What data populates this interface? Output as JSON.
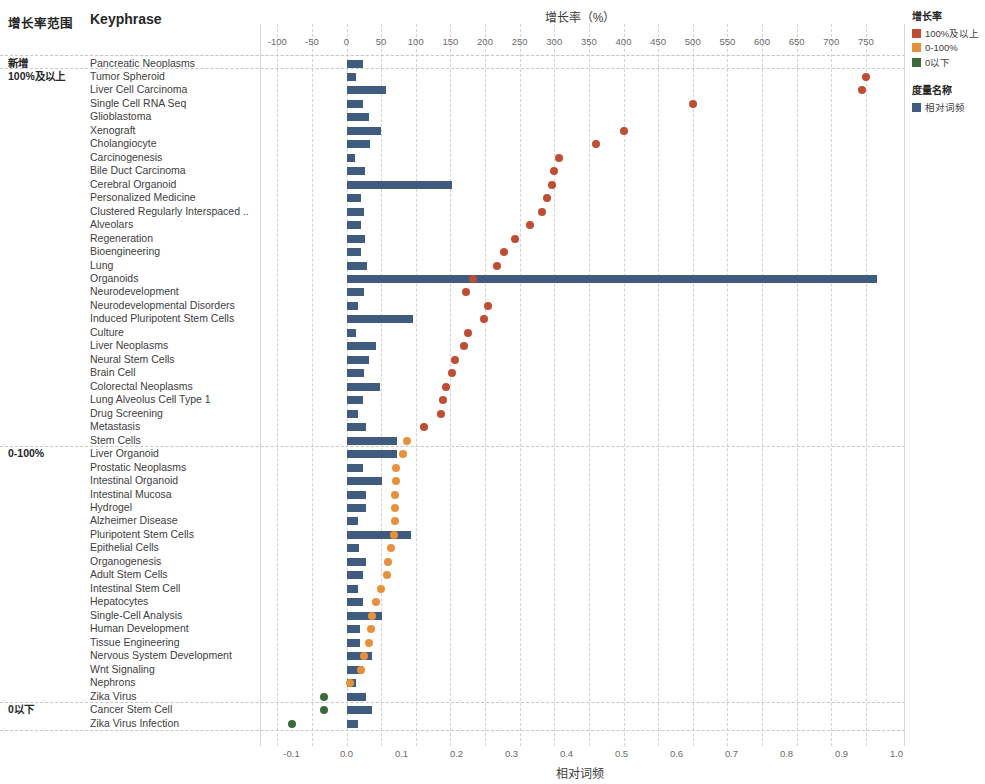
{
  "headers": {
    "range_column": "增长率范围",
    "keyphrase_column": "Keyphrase",
    "top_axis_title": "增长率（%）",
    "bottom_axis_title": "相对词频"
  },
  "legend": {
    "growth_title": "增长率",
    "growth_items": [
      {
        "label": "100%及以上",
        "color": "#bf4d33"
      },
      {
        "label": "0-100%",
        "color": "#e8913c"
      },
      {
        "label": "0以下",
        "color": "#3c6b3b"
      }
    ],
    "measure_title": "度量名称",
    "measure_items": [
      {
        "label": "相对词频",
        "color": "#3f5b7d"
      }
    ]
  },
  "groups": [
    {
      "label": "新增",
      "row_start": 0,
      "row_end": 0
    },
    {
      "label": "100%及以上",
      "row_start": 1,
      "row_end": 28
    },
    {
      "label": "0-100%",
      "row_start": 29,
      "row_end": 47
    },
    {
      "label": "0以下",
      "row_start": 48,
      "row_end": 50
    }
  ],
  "chart_data": {
    "type": "bar",
    "title": "增长率（%）",
    "xlabel": "相对词频",
    "x2label": "增长率（%）",
    "grid": true,
    "legend_position": "right",
    "top_axis": {
      "label": "增长率（%）",
      "ticks": [
        -100,
        -50,
        0,
        50,
        100,
        150,
        200,
        250,
        300,
        350,
        400,
        450,
        500,
        550,
        600,
        650,
        700,
        750
      ],
      "range": [
        -118,
        775
      ]
    },
    "bottom_axis": {
      "label": "相对词频",
      "ticks": [
        -0.1,
        0.0,
        0.1,
        0.2,
        0.3,
        0.4,
        0.5,
        0.6,
        0.7,
        0.8,
        0.9,
        1.0
      ],
      "range": [
        -0.118,
        1.03
      ]
    },
    "series": [
      {
        "name": "相对词频",
        "type": "bar",
        "color": "#3f5b7d",
        "axis": "bottom"
      },
      {
        "name": "增长率",
        "type": "scatter",
        "axis": "top"
      }
    ],
    "categories": [
      "Pancreatic Neoplasms",
      "Tumor Spheroid",
      "Liver Cell Carcinoma",
      "Single Cell RNA Seq",
      "Glioblastoma",
      "Xenograft",
      "Cholangiocyte",
      "Carcinogenesis",
      "Bile Duct Carcinoma",
      "Cerebral Organoid",
      "Personalized Medicine",
      "Clustered Regularly Interspaced ..",
      "Alveolars",
      "Regeneration",
      "Bioengineering",
      "Lung",
      "Organoids",
      "Neurodevelopment",
      "Neurodevelopmental Disorders",
      "Induced Pluripotent Stem Cells",
      "Culture",
      "Liver Neoplasms",
      "Neural Stem Cells",
      "Brain Cell",
      "Colorectal Neoplasms",
      "Lung Alveolus Cell Type 1",
      "Drug Screening",
      "Metastasis",
      "Stem Cells",
      "Liver Organoid",
      "Prostatic Neoplasms",
      "Intestinal Organoid",
      "Intestinal Mucosa",
      "Hydrogel",
      "Alzheimer Disease",
      "Pluripotent Stem Cells",
      "Epithelial Cells",
      "Organogenesis",
      "Adult Stem Cells",
      "Intestinal Stem Cell",
      "Hepatocytes",
      "Single-Cell Analysis",
      "Human Development",
      "Tissue Engineering",
      "Nervous System Development",
      "Wnt Signaling",
      "Nephrons",
      "Zika Virus",
      "Cancer Stem Cell",
      "Zika Virus Infection"
    ],
    "rows": [
      {
        "keyphrase": "Pancreatic Neoplasms",
        "freq": 0.03,
        "growth": null,
        "group": "新增"
      },
      {
        "keyphrase": "Tumor Spheroid",
        "freq": 0.018,
        "growth": 750,
        "group": "100%及以上"
      },
      {
        "keyphrase": "Liver Cell Carcinoma",
        "freq": 0.072,
        "growth": 745,
        "group": "100%及以上"
      },
      {
        "keyphrase": "Single Cell RNA Seq",
        "freq": 0.03,
        "growth": 500,
        "group": "100%及以上"
      },
      {
        "keyphrase": "Glioblastoma",
        "freq": 0.041,
        "growth": null,
        "group": "100%及以上"
      },
      {
        "keyphrase": "Xenograft",
        "freq": 0.062,
        "growth": 400,
        "group": "100%及以上"
      },
      {
        "keyphrase": "Cholangiocyte",
        "freq": 0.043,
        "growth": 360,
        "group": "100%及以上"
      },
      {
        "keyphrase": "Carcinogenesis",
        "freq": 0.015,
        "growth": 307,
        "group": "100%及以上"
      },
      {
        "keyphrase": "Bile Duct Carcinoma",
        "freq": 0.033,
        "growth": 300,
        "group": "100%及以上"
      },
      {
        "keyphrase": "Cerebral Organoid",
        "freq": 0.192,
        "growth": 297,
        "group": "100%及以上"
      },
      {
        "keyphrase": "Personalized Medicine",
        "freq": 0.027,
        "growth": 290,
        "group": "100%及以上"
      },
      {
        "keyphrase": "Clustered Regularly Interspaced ..",
        "freq": 0.031,
        "growth": 282,
        "group": "100%及以上"
      },
      {
        "keyphrase": "Alveolars",
        "freq": 0.027,
        "growth": 265,
        "group": "100%及以上"
      },
      {
        "keyphrase": "Regeneration",
        "freq": 0.034,
        "growth": 244,
        "group": "100%及以上"
      },
      {
        "keyphrase": "Bioengineering",
        "freq": 0.026,
        "growth": 227,
        "group": "100%及以上"
      },
      {
        "keyphrase": "Lung",
        "freq": 0.037,
        "growth": 218,
        "group": "100%及以上"
      },
      {
        "keyphrase": "Organoids",
        "freq": 0.965,
        "growth": 183,
        "group": "100%及以上"
      },
      {
        "keyphrase": "Neurodevelopment",
        "freq": 0.032,
        "growth": 172,
        "group": "100%及以上"
      },
      {
        "keyphrase": "Neurodevelopmental Disorders",
        "freq": 0.021,
        "growth": 205,
        "group": "100%及以上"
      },
      {
        "keyphrase": "Induced Pluripotent Stem Cells",
        "freq": 0.12,
        "growth": 198,
        "group": "100%及以上"
      },
      {
        "keyphrase": "Culture",
        "freq": 0.017,
        "growth": 176,
        "group": "100%及以上"
      },
      {
        "keyphrase": "Liver Neoplasms",
        "freq": 0.054,
        "growth": 169,
        "group": "100%及以上"
      },
      {
        "keyphrase": "Neural Stem Cells",
        "freq": 0.041,
        "growth": 157,
        "group": "100%及以上"
      },
      {
        "keyphrase": "Brain Cell",
        "freq": 0.032,
        "growth": 152,
        "group": "100%及以上"
      },
      {
        "keyphrase": "Colorectal Neoplasms",
        "freq": 0.06,
        "growth": 143,
        "group": "100%及以上"
      },
      {
        "keyphrase": "Lung Alveolus Cell Type 1",
        "freq": 0.03,
        "growth": 139,
        "group": "100%及以上"
      },
      {
        "keyphrase": "Drug Screening",
        "freq": 0.02,
        "growth": 137,
        "group": "100%及以上"
      },
      {
        "keyphrase": "Metastasis",
        "freq": 0.036,
        "growth": 112,
        "group": "100%及以上"
      },
      {
        "keyphrase": "Stem Cells",
        "freq": 0.092,
        "growth": 88,
        "group": "0-100%"
      },
      {
        "keyphrase": "Liver Organoid",
        "freq": 0.092,
        "growth": 82,
        "group": "0-100%"
      },
      {
        "keyphrase": "Prostatic Neoplasms",
        "freq": 0.03,
        "growth": 72,
        "group": "0-100%"
      },
      {
        "keyphrase": "Intestinal Organoid",
        "freq": 0.064,
        "growth": 72,
        "group": "0-100%"
      },
      {
        "keyphrase": "Intestinal Mucosa",
        "freq": 0.035,
        "growth": 70,
        "group": "0-100%"
      },
      {
        "keyphrase": "Hydrogel",
        "freq": 0.036,
        "growth": 70,
        "group": "0-100%"
      },
      {
        "keyphrase": "Alzheimer Disease",
        "freq": 0.021,
        "growth": 70,
        "group": "0-100%"
      },
      {
        "keyphrase": "Pluripotent Stem Cells",
        "freq": 0.118,
        "growth": 68,
        "group": "0-100%"
      },
      {
        "keyphrase": "Epithelial Cells",
        "freq": 0.022,
        "growth": 64,
        "group": "0-100%"
      },
      {
        "keyphrase": "Organogenesis",
        "freq": 0.036,
        "growth": 60,
        "group": "0-100%"
      },
      {
        "keyphrase": "Adult Stem Cells",
        "freq": 0.03,
        "growth": 58,
        "group": "0-100%"
      },
      {
        "keyphrase": "Intestinal Stem Cell",
        "freq": 0.02,
        "growth": 50,
        "group": "0-100%"
      },
      {
        "keyphrase": "Hepatocytes",
        "freq": 0.03,
        "growth": 42,
        "group": "0-100%"
      },
      {
        "keyphrase": "Single-Cell Analysis",
        "freq": 0.064,
        "growth": 37,
        "group": "0-100%"
      },
      {
        "keyphrase": "Human Development",
        "freq": 0.024,
        "growth": 35,
        "group": "0-100%"
      },
      {
        "keyphrase": "Tissue Engineering",
        "freq": 0.024,
        "growth": 33,
        "group": "0-100%"
      },
      {
        "keyphrase": "Nervous System Development",
        "freq": 0.046,
        "growth": 25,
        "group": "0-100%"
      },
      {
        "keyphrase": "Wnt Signaling",
        "freq": 0.03,
        "growth": 21,
        "group": "0-100%"
      },
      {
        "keyphrase": "Nephrons",
        "freq": 0.018,
        "growth": 5,
        "group": "0-100%"
      },
      {
        "keyphrase": "Zika Virus",
        "freq": 0.036,
        "growth": -33,
        "group": "0以下"
      },
      {
        "keyphrase": "Cancer Stem Cell",
        "freq": 0.046,
        "growth": -33,
        "group": "0以下"
      },
      {
        "keyphrase": "Zika Virus Infection",
        "freq": 0.021,
        "growth": -79,
        "group": "0以下"
      }
    ]
  }
}
